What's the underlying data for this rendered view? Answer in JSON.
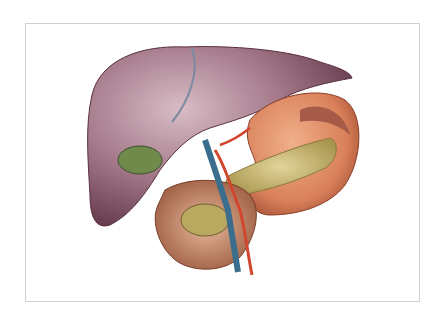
{
  "image": {
    "subject": "Anatomical illustration of liver, gallbladder, stomach, pancreas and duodenum",
    "frame": {
      "border_color": "#cfcfcf",
      "background": "#ffffff"
    },
    "colors": {
      "liver": "#8a5a6e",
      "liver_highlight": "#c9a9b6",
      "gallbladder": "#6f8a4a",
      "stomach": "#d9805a",
      "pancreas": "#c9b77a",
      "duodenum": "#c98a6a",
      "vein": "#3a6e8c",
      "artery": "#d2452f"
    }
  }
}
